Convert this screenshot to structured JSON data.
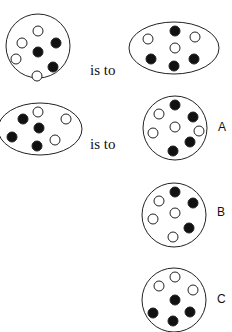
{
  "connector_text": "is to",
  "colors": {
    "stroke": "#222222",
    "filled": "#111111",
    "empty": "#ffffff"
  },
  "figures": [
    {
      "id": "q1",
      "shape": "circle",
      "cx": 38,
      "cy": 46,
      "rx": 32,
      "ry": 32,
      "dots": [
        {
          "x": 38,
          "y": 31,
          "fill": "white"
        },
        {
          "x": 56,
          "y": 43,
          "fill": "black"
        },
        {
          "x": 22,
          "y": 43,
          "fill": "white"
        },
        {
          "x": 38,
          "y": 52,
          "fill": "black"
        },
        {
          "x": 16,
          "y": 59,
          "fill": "white"
        },
        {
          "x": 53,
          "y": 67,
          "fill": "black"
        },
        {
          "x": 37,
          "y": 76,
          "fill": "white"
        }
      ]
    },
    {
      "id": "q2",
      "shape": "ellipse",
      "cx": 174,
      "cy": 48,
      "rx": 45,
      "ry": 26,
      "dots": [
        {
          "x": 175,
          "y": 31,
          "fill": "black"
        },
        {
          "x": 148,
          "y": 39,
          "fill": "white"
        },
        {
          "x": 195,
          "y": 37,
          "fill": "white"
        },
        {
          "x": 175,
          "y": 48,
          "fill": "white"
        },
        {
          "x": 151,
          "y": 59,
          "fill": "black"
        },
        {
          "x": 194,
          "y": 59,
          "fill": "black"
        },
        {
          "x": 174,
          "y": 66,
          "fill": "black"
        }
      ]
    },
    {
      "id": "q3",
      "shape": "ellipse",
      "cx": 40,
      "cy": 129,
      "rx": 42,
      "ry": 26,
      "dots": [
        {
          "x": 38,
          "y": 112,
          "fill": "white"
        },
        {
          "x": 23,
          "y": 119,
          "fill": "black"
        },
        {
          "x": 66,
          "y": 119,
          "fill": "white"
        },
        {
          "x": 39,
          "y": 128,
          "fill": "black"
        },
        {
          "x": 12,
          "y": 137,
          "fill": "black"
        },
        {
          "x": 55,
          "y": 140,
          "fill": "white"
        },
        {
          "x": 37,
          "y": 146,
          "fill": "black"
        }
      ]
    },
    {
      "id": "A",
      "shape": "circle",
      "cx": 175,
      "cy": 128,
      "rx": 32,
      "ry": 32,
      "dots": [
        {
          "x": 175,
          "y": 105,
          "fill": "black"
        },
        {
          "x": 159,
          "y": 114,
          "fill": "white"
        },
        {
          "x": 193,
          "y": 117,
          "fill": "black"
        },
        {
          "x": 175,
          "y": 127,
          "fill": "white"
        },
        {
          "x": 199,
          "y": 131,
          "fill": "white"
        },
        {
          "x": 153,
          "y": 133,
          "fill": "white"
        },
        {
          "x": 190,
          "y": 142,
          "fill": "black"
        },
        {
          "x": 173,
          "y": 151,
          "fill": "black"
        }
      ]
    },
    {
      "id": "B",
      "shape": "circle",
      "cx": 174,
      "cy": 215,
      "rx": 32,
      "ry": 32,
      "dots": [
        {
          "x": 175,
          "y": 192,
          "fill": "black"
        },
        {
          "x": 159,
          "y": 201,
          "fill": "white"
        },
        {
          "x": 193,
          "y": 203,
          "fill": "black"
        },
        {
          "x": 175,
          "y": 213,
          "fill": "white"
        },
        {
          "x": 153,
          "y": 219,
          "fill": "white"
        },
        {
          "x": 189,
          "y": 228,
          "fill": "black"
        },
        {
          "x": 173,
          "y": 237,
          "fill": "white"
        }
      ]
    },
    {
      "id": "C",
      "shape": "circle",
      "cx": 174,
      "cy": 300,
      "rx": 32,
      "ry": 32,
      "dots": [
        {
          "x": 175,
          "y": 277,
          "fill": "white"
        },
        {
          "x": 159,
          "y": 286,
          "fill": "white"
        },
        {
          "x": 193,
          "y": 290,
          "fill": "white"
        },
        {
          "x": 175,
          "y": 300,
          "fill": "black"
        },
        {
          "x": 153,
          "y": 313,
          "fill": "black"
        },
        {
          "x": 190,
          "y": 312,
          "fill": "black"
        },
        {
          "x": 173,
          "y": 321,
          "fill": "black"
        }
      ]
    }
  ],
  "options": [
    {
      "label": "A",
      "x": 218,
      "y": 120
    },
    {
      "label": "B",
      "x": 217,
      "y": 205
    },
    {
      "label": "C",
      "x": 217,
      "y": 292
    }
  ]
}
